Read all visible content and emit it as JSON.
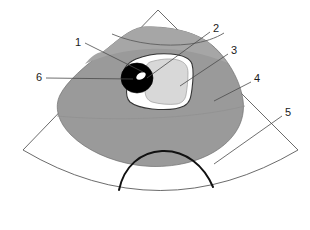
{
  "figure": {
    "type": "labeled-medical-diagram",
    "canvas": {
      "width": 310,
      "height": 230
    },
    "background_color": "#ffffff"
  },
  "colors": {
    "background": "#ffffff",
    "sector_fill": "#ffffff",
    "sector_stroke": "#5a5a5a",
    "tissue_mass_fill": "#9a9a9a",
    "tissue_mass_upper_fill": "#a6a6a6",
    "tissue_mass_stroke": "#6e6e6e",
    "lesion_rim_fill": "#ffffff",
    "lesion_rim_stroke": "#3a3a3a",
    "lesion_interior_fill": "#d8d8d8",
    "lesion_interior_stroke": "#9c9c9c",
    "calculus_fill": "#000000",
    "calculus_highlight_fill": "#ffffff",
    "shadow_arc_stroke": "#111111",
    "leader_line_stroke": "#4a4a4a",
    "label_text": "#1a1a1a"
  },
  "labels": [
    {
      "id": "1",
      "text": "1",
      "x": 78,
      "y": 43,
      "leader_to_x": 143,
      "leader_to_y": 72,
      "describes": "lesion-rim-upper-left"
    },
    {
      "id": "2",
      "text": "2",
      "x": 216,
      "y": 29,
      "leader_to_x": 147,
      "leader_to_y": 78,
      "describes": "calculus-edge"
    },
    {
      "id": "3",
      "text": "3",
      "x": 234,
      "y": 51,
      "leader_to_x": 180,
      "leader_to_y": 86,
      "describes": "lesion-interior"
    },
    {
      "id": "4",
      "text": "4",
      "x": 257,
      "y": 79,
      "leader_to_x": 214,
      "leader_to_y": 101,
      "describes": "tissue-mass"
    },
    {
      "id": "5",
      "text": "5",
      "x": 288,
      "y": 113,
      "leader_to_x": 214,
      "leader_to_y": 164,
      "describes": "acoustic-shadow-arc"
    },
    {
      "id": "6",
      "text": "6",
      "x": 39,
      "y": 78,
      "leader_to_x": 133,
      "leader_to_y": 79,
      "describes": "calculus-black-focus"
    }
  ],
  "shapes": {
    "sector": {
      "name": "ultrasound-sector-fan",
      "apex_x": 158,
      "apex_y": 10,
      "left_corner_x": 23,
      "left_corner_y": 150,
      "right_corner_x": 298,
      "right_corner_y": 150,
      "outer_arc_bottom_x": 160,
      "outer_arc_bottom_y": 224
    },
    "tissue_mass": {
      "name": "hyperechoic-tissue-mass",
      "shade": "mid-gray"
    },
    "lesion": {
      "name": "lesion-with-rim",
      "rim": "white",
      "interior": "light-gray"
    },
    "calculus": {
      "name": "calculus-focus",
      "fill": "black",
      "highlight": "white-crescent"
    },
    "shadow_arc": {
      "name": "acoustic-shadow-dome",
      "stroke": "black"
    }
  }
}
